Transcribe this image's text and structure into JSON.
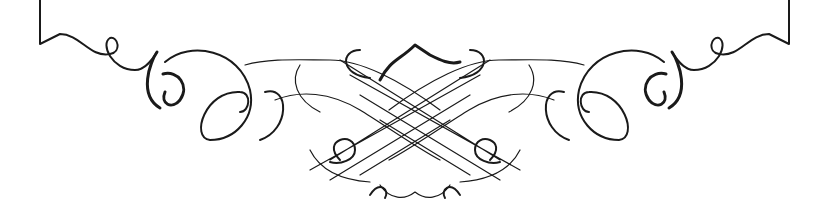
{
  "image": {
    "description": "Symmetric black-and-white calligraphic flourish ornament with central interlaced lattice and scroll curls on each side, bracketed by vertical frame lines at left and right edges",
    "colors": {
      "background": "#ffffff",
      "ink": "#1a1a1a"
    }
  }
}
